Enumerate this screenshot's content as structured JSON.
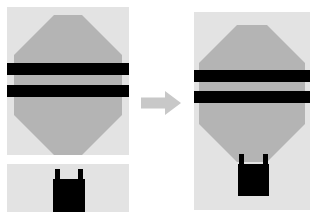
{
  "canvas": {
    "width": 317,
    "height": 218,
    "background": "#ffffff"
  },
  "palette": {
    "page_background": "#ffffff",
    "panel_background": "#e3e3e3",
    "envelope_fill": "#b4b4b4",
    "stripe_fill": "#000000",
    "basket_fill": "#000000",
    "arrow_fill": "#c8c8c8"
  },
  "panels": [
    {
      "id": "source-envelope-panel",
      "label": "Balloon envelope source image",
      "x": 7,
      "y": 7,
      "width": 122,
      "height": 148,
      "background": "#e3e3e3",
      "shapes": {
        "envelope": {
          "name": "balloon-envelope-shape",
          "type": "octagon",
          "fill": "#b4b4b4",
          "x": 7,
          "y": 8,
          "width": 108,
          "height": 140,
          "corner_cut": 40
        },
        "stripes": [
          {
            "name": "envelope-stripe-upper",
            "fill": "#000000",
            "x": 0,
            "y": 56,
            "width": 122,
            "height": 12
          },
          {
            "name": "envelope-stripe-lower",
            "fill": "#000000",
            "x": 0,
            "y": 78,
            "width": 122,
            "height": 12
          }
        ]
      }
    },
    {
      "id": "source-basket-panel",
      "label": "Balloon basket source image",
      "x": 7,
      "y": 164,
      "width": 122,
      "height": 48,
      "background": "#e3e3e3",
      "shapes": {
        "basket": {
          "name": "balloon-basket-shape",
          "type": "square",
          "fill": "#000000",
          "x": 46,
          "y": 15,
          "width": 32,
          "height": 33
        },
        "risers": [
          {
            "name": "basket-riser-left",
            "fill": "#000000",
            "x": 48,
            "y": 5,
            "width": 5,
            "height": 11
          },
          {
            "name": "basket-riser-right",
            "fill": "#000000",
            "x": 71,
            "y": 5,
            "width": 5,
            "height": 11
          }
        ]
      }
    },
    {
      "id": "result-composite-panel",
      "label": "Composited hot air balloon result",
      "x": 194,
      "y": 12,
      "width": 116,
      "height": 198,
      "background": "#e3e3e3",
      "shapes": {
        "envelope": {
          "name": "balloon-envelope-shape",
          "type": "octagon",
          "fill": "#b4b4b4",
          "x": 5,
          "y": 13,
          "width": 106,
          "height": 137,
          "corner_cut": 38
        },
        "stripes": [
          {
            "name": "envelope-stripe-upper",
            "fill": "#000000",
            "x": 0,
            "y": 58,
            "width": 116,
            "height": 12
          },
          {
            "name": "envelope-stripe-lower",
            "fill": "#000000",
            "x": 0,
            "y": 79,
            "width": 116,
            "height": 12
          }
        ],
        "basket": {
          "name": "balloon-basket-shape",
          "type": "square",
          "fill": "#000000",
          "x": 44,
          "y": 152,
          "width": 31,
          "height": 32
        },
        "risers": [
          {
            "name": "basket-riser-left",
            "fill": "#000000",
            "x": 45,
            "y": 142,
            "width": 5,
            "height": 11
          },
          {
            "name": "basket-riser-right",
            "fill": "#000000",
            "x": 69,
            "y": 142,
            "width": 5,
            "height": 11
          }
        ]
      }
    }
  ],
  "arrow": {
    "name": "transform-arrow",
    "label": "Arrow pointing right from sources to result",
    "direction": "right",
    "fill": "#c8c8c8",
    "x": 141,
    "y": 91,
    "width": 40,
    "height": 24
  }
}
